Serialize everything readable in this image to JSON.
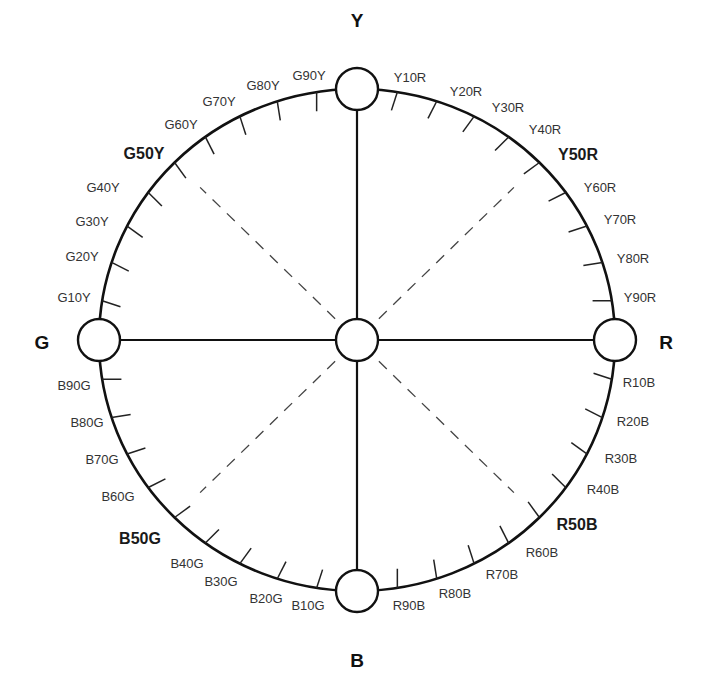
{
  "diagram": {
    "title": "",
    "type": "NCS hue circle",
    "colors": {
      "stroke": "#111111",
      "tick": "#222222",
      "dash": "#444444",
      "text": "#333333"
    },
    "geometry": {
      "cx": 357,
      "cy": 340,
      "rx": 258,
      "ry": 251,
      "node_r": 21,
      "tick_len": 20
    },
    "primaries": [
      {
        "label": "Y",
        "angle": 0,
        "x": 357,
        "y": 27
      },
      {
        "label": "R",
        "angle": 90,
        "x": 666,
        "y": 349
      },
      {
        "label": "B",
        "angle": 180,
        "x": 357,
        "y": 667
      },
      {
        "label": "G",
        "angle": 270,
        "x": 42,
        "y": 349
      }
    ],
    "center_node": {
      "label": ""
    },
    "hues": [
      {
        "label": "Y10R",
        "angle": 9,
        "x": 410,
        "y": 82,
        "bold": false
      },
      {
        "label": "Y20R",
        "angle": 18,
        "x": 466,
        "y": 96,
        "bold": false
      },
      {
        "label": "Y30R",
        "angle": 27,
        "x": 508,
        "y": 112,
        "bold": false
      },
      {
        "label": "Y40R",
        "angle": 36,
        "x": 545,
        "y": 134,
        "bold": false
      },
      {
        "label": "Y50R",
        "angle": 45,
        "x": 578,
        "y": 160,
        "bold": true
      },
      {
        "label": "Y60R",
        "angle": 54,
        "x": 600,
        "y": 192,
        "bold": false
      },
      {
        "label": "Y70R",
        "angle": 63,
        "x": 620,
        "y": 224,
        "bold": false
      },
      {
        "label": "Y80R",
        "angle": 72,
        "x": 633,
        "y": 263,
        "bold": false
      },
      {
        "label": "Y90R",
        "angle": 81,
        "x": 640,
        "y": 302,
        "bold": false
      },
      {
        "label": "R10B",
        "angle": 99,
        "x": 639,
        "y": 387,
        "bold": false
      },
      {
        "label": "R20B",
        "angle": 108,
        "x": 633,
        "y": 426,
        "bold": false
      },
      {
        "label": "R30B",
        "angle": 117,
        "x": 621,
        "y": 463,
        "bold": false
      },
      {
        "label": "R40B",
        "angle": 126,
        "x": 603,
        "y": 494,
        "bold": false
      },
      {
        "label": "R50B",
        "angle": 135,
        "x": 577,
        "y": 530,
        "bold": true
      },
      {
        "label": "R60B",
        "angle": 144,
        "x": 542,
        "y": 557,
        "bold": false
      },
      {
        "label": "R70B",
        "angle": 153,
        "x": 502,
        "y": 579,
        "bold": false
      },
      {
        "label": "R80B",
        "angle": 162,
        "x": 455,
        "y": 598,
        "bold": false
      },
      {
        "label": "R90B",
        "angle": 171,
        "x": 409,
        "y": 610,
        "bold": false
      },
      {
        "label": "B10G",
        "angle": 189,
        "x": 308,
        "y": 610,
        "bold": false
      },
      {
        "label": "B20G",
        "angle": 198,
        "x": 266,
        "y": 603,
        "bold": false
      },
      {
        "label": "B30G",
        "angle": 207,
        "x": 221,
        "y": 586,
        "bold": false
      },
      {
        "label": "B40G",
        "angle": 216,
        "x": 187,
        "y": 568,
        "bold": false
      },
      {
        "label": "B50G",
        "angle": 225,
        "x": 140,
        "y": 544,
        "bold": true
      },
      {
        "label": "B60G",
        "angle": 234,
        "x": 118,
        "y": 501,
        "bold": false
      },
      {
        "label": "B70G",
        "angle": 243,
        "x": 102,
        "y": 464,
        "bold": false
      },
      {
        "label": "B80G",
        "angle": 252,
        "x": 87,
        "y": 427,
        "bold": false
      },
      {
        "label": "B90G",
        "angle": 261,
        "x": 74,
        "y": 390,
        "bold": false
      },
      {
        "label": "G10Y",
        "angle": 279,
        "x": 74,
        "y": 302,
        "bold": false
      },
      {
        "label": "G20Y",
        "angle": 288,
        "x": 82,
        "y": 261,
        "bold": false
      },
      {
        "label": "G30Y",
        "angle": 297,
        "x": 92,
        "y": 226,
        "bold": false
      },
      {
        "label": "G40Y",
        "angle": 306,
        "x": 103,
        "y": 192,
        "bold": false
      },
      {
        "label": "G50Y",
        "angle": 315,
        "x": 144,
        "y": 159,
        "bold": true
      },
      {
        "label": "G60Y",
        "angle": 324,
        "x": 181,
        "y": 129,
        "bold": false
      },
      {
        "label": "G70Y",
        "angle": 333,
        "x": 219,
        "y": 106,
        "bold": false
      },
      {
        "label": "G80Y",
        "angle": 342,
        "x": 263,
        "y": 90,
        "bold": false
      },
      {
        "label": "G90Y",
        "angle": 351,
        "x": 309,
        "y": 80,
        "bold": false
      }
    ]
  }
}
